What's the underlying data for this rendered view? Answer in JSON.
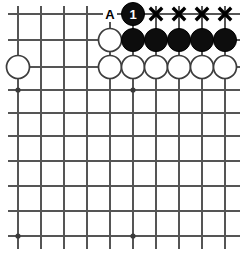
{
  "diagram": {
    "board": {
      "columns": 10,
      "rows": 10,
      "line_color": "#555555",
      "background_color": "#ffffff",
      "x_coords": [
        18,
        41,
        64,
        87,
        110,
        133,
        156,
        179,
        202,
        225
      ],
      "y_coords": [
        14,
        40,
        67,
        90,
        113,
        136,
        161,
        186,
        211,
        236
      ]
    },
    "star_points": [
      {
        "col": 0,
        "row": 3
      },
      {
        "col": 5,
        "row": 3
      },
      {
        "col": 0,
        "row": 9
      },
      {
        "col": 5,
        "row": 9
      }
    ],
    "stones": [
      {
        "col": 0,
        "row": 2,
        "color": "white",
        "label": ""
      },
      {
        "col": 5,
        "row": 0,
        "color": "black",
        "label": "1"
      },
      {
        "col": 4,
        "row": 1,
        "color": "white",
        "label": ""
      },
      {
        "col": 5,
        "row": 1,
        "color": "black",
        "label": ""
      },
      {
        "col": 6,
        "row": 1,
        "color": "black",
        "label": ""
      },
      {
        "col": 7,
        "row": 1,
        "color": "black",
        "label": ""
      },
      {
        "col": 8,
        "row": 1,
        "color": "black",
        "label": ""
      },
      {
        "col": 9,
        "row": 1,
        "color": "black",
        "label": ""
      },
      {
        "col": 4,
        "row": 2,
        "color": "white",
        "label": ""
      },
      {
        "col": 5,
        "row": 2,
        "color": "white",
        "label": ""
      },
      {
        "col": 6,
        "row": 2,
        "color": "white",
        "label": ""
      },
      {
        "col": 7,
        "row": 2,
        "color": "white",
        "label": ""
      },
      {
        "col": 8,
        "row": 2,
        "color": "white",
        "label": ""
      },
      {
        "col": 9,
        "row": 2,
        "color": "white",
        "label": ""
      }
    ],
    "marks": [
      {
        "col": 6,
        "row": 0,
        "type": "x",
        "text": "X"
      },
      {
        "col": 7,
        "row": 0,
        "type": "x",
        "text": "X"
      },
      {
        "col": 8,
        "row": 0,
        "type": "x",
        "text": "X"
      },
      {
        "col": 9,
        "row": 0,
        "type": "x",
        "text": "X"
      }
    ],
    "point_labels": [
      {
        "col": 4,
        "row": 0,
        "text": "A"
      }
    ],
    "stone_colors": {
      "black_fill": "#0d0d0d",
      "white_fill": "#ffffff",
      "white_stroke": "#3d3d3d",
      "number_color": "#ffffff",
      "mark_color": "#000000"
    },
    "stone_radius": 11.5
  }
}
